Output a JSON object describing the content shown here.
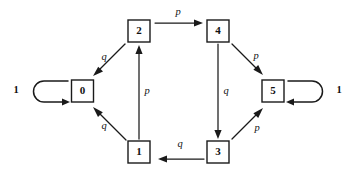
{
  "diagram": {
    "type": "state-transition-diagram",
    "background_color": "#ffffff",
    "stroke_color": "#1a1a1a",
    "nodes": [
      {
        "id": "0",
        "label": "0",
        "cx": 82.5,
        "cy": 91
      },
      {
        "id": "1",
        "label": "1",
        "cx": 139,
        "cy": 152
      },
      {
        "id": "2",
        "label": "2",
        "cx": 139,
        "cy": 31
      },
      {
        "id": "3",
        "label": "3",
        "cx": 218,
        "cy": 152
      },
      {
        "id": "4",
        "label": "4",
        "cx": 218,
        "cy": 31
      },
      {
        "id": "5",
        "label": "5",
        "cx": 273,
        "cy": 91
      }
    ],
    "edges": [
      {
        "from": "2",
        "to": "4",
        "label": "p",
        "label_x": 178,
        "label_y": 13
      },
      {
        "from": "2",
        "to": "0",
        "label": "q",
        "label_x": 104,
        "label_y": 58
      },
      {
        "from": "1",
        "to": "0",
        "label": "q",
        "label_x": 104,
        "label_y": 127
      },
      {
        "from": "1",
        "to": "2",
        "label": "p",
        "label_x": 147,
        "label_y": 92
      },
      {
        "from": "3",
        "to": "1",
        "label": "q",
        "label_x": 180,
        "label_y": 145
      },
      {
        "from": "4",
        "to": "3",
        "label": "q",
        "label_x": 226,
        "label_y": 92
      },
      {
        "from": "4",
        "to": "5",
        "label": "p",
        "label_x": 256,
        "label_y": 57
      },
      {
        "from": "3",
        "to": "5",
        "label": "p",
        "label_x": 257,
        "label_y": 129
      }
    ],
    "self_loops": [
      {
        "node": "0",
        "label": "1",
        "side": "left",
        "label_x": 16,
        "label_y": 91
      },
      {
        "node": "5",
        "label": "1",
        "side": "right",
        "label_x": 339,
        "label_y": 91
      }
    ]
  }
}
